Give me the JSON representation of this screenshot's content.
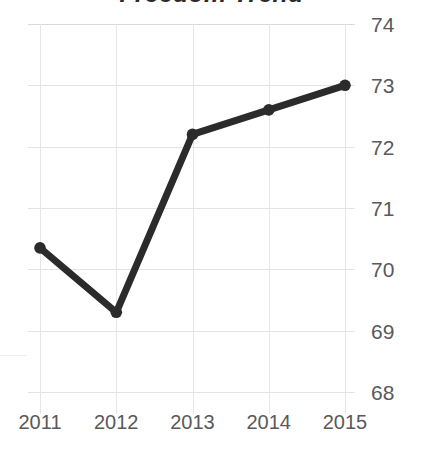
{
  "chart_data": {
    "type": "line",
    "title": "Freedom Trend",
    "xlabel": "",
    "ylabel": "",
    "categories": [
      "2011",
      "2012",
      "2013",
      "2014",
      "2015"
    ],
    "values": [
      70.35,
      69.3,
      72.2,
      72.6,
      73.0
    ],
    "series": [
      {
        "name": "Freedom Trend",
        "values": [
          70.35,
          69.3,
          72.2,
          72.6,
          73.0
        ]
      }
    ],
    "ylim": [
      68,
      74
    ],
    "yticks": [
      74,
      73,
      72,
      71,
      70,
      69,
      68
    ],
    "ytick_labels": [
      "74",
      "73",
      "72",
      "71",
      "70",
      "69",
      "68"
    ],
    "xtick_labels": [
      "2011",
      "2012",
      "2013",
      "2014",
      "2015"
    ],
    "y_axis_position": "right",
    "grid": true,
    "grid_axis": "both",
    "legend": false,
    "legend_position": "none",
    "marker": "circle",
    "line_color": "#2b2b2b",
    "marker_color": "#2b2b2b",
    "grid_color": "#e3e3e3",
    "tick_label_color": "#595959",
    "title_color": "#2b2b2b",
    "background_color": "#ffffff",
    "annotations": [],
    "note": "Chart title is clipped by the top edge of the screenshot."
  }
}
